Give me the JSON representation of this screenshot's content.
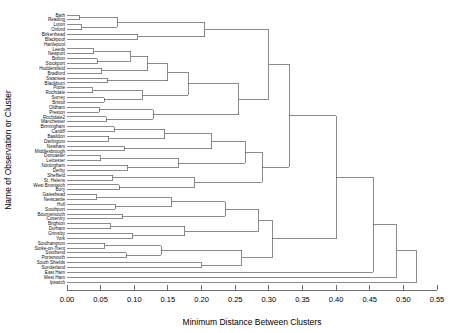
{
  "figure": {
    "type": "dendrogram",
    "xlabel": "Minimum Distance Between Clusters",
    "ylabel": "Name of Observation or Cluster"
  },
  "axis": {
    "ticks": [
      "0.00",
      "0.05",
      "0.10",
      "0.15",
      "0.20",
      "0.25",
      "0.30",
      "0.35",
      "0.40",
      "0.45",
      "0.50",
      "0.55"
    ],
    "tick_values": [
      0.0,
      0.05,
      0.1,
      0.15,
      0.2,
      0.25,
      0.3,
      0.35,
      0.4,
      0.45,
      0.5,
      0.55
    ],
    "xlim": [
      0.0,
      0.55
    ]
  },
  "chart_data": {
    "type": "dendrogram",
    "title": "",
    "xlabel": "Minimum Distance Between Clusters",
    "ylabel": "Name of Observation or Cluster",
    "xlim": [
      0.0,
      0.55
    ],
    "grid": false,
    "legend": "none",
    "orientation": "horizontal",
    "leaf_count": 56,
    "leaves": [
      "Bath",
      "Reading",
      "Luton",
      "Oxford",
      "Birkenhead",
      "Blackpool",
      "Hartlepool",
      "Leeds",
      "Newport",
      "Bolton",
      "Stockport",
      "Huddersfield",
      "Bradford",
      "Swansea",
      "Blackburn",
      "Poole",
      "Rochdale",
      "Surrey",
      "Bristol",
      "Oldham",
      "Preston",
      "Rochdale2",
      "Manchester",
      "Birmingham",
      "Cardiff",
      "Basildon",
      "Darlington",
      "Newham",
      "Middlesbrough",
      "Doncaster",
      "Leicester",
      "Nottingham",
      "Derby",
      "Sheffield",
      "St. Helens",
      "West Bromwich",
      "Bury",
      "Gateshead",
      "Newcastle",
      "Hull",
      "Southport",
      "Bournemouth",
      "Coventry",
      "Brighton",
      "Durham",
      "Grimsby",
      "York",
      "Southampton",
      "Stoke-on-Trent",
      "Southend",
      "Portsmouth",
      "South Shields",
      "Sunderland",
      "East Ham",
      "West Ham",
      "Ipswich"
    ],
    "merges": [
      {
        "children": [
          0,
          1
        ],
        "height": 0.018
      },
      {
        "children": [
          2,
          3
        ],
        "height": 0.022
      },
      {
        "children": [
          "m0",
          "m1"
        ],
        "height": 0.075
      },
      {
        "children": [
          4,
          5
        ],
        "height": 0.105
      },
      {
        "children": [
          "m2",
          "m3"
        ],
        "height": 0.205
      },
      {
        "children": [
          7,
          8
        ],
        "height": 0.04
      },
      {
        "children": [
          9,
          10
        ],
        "height": 0.045
      },
      {
        "children": [
          11,
          12
        ],
        "height": 0.052
      },
      {
        "children": [
          "m5",
          "m6"
        ],
        "height": 0.095
      },
      {
        "children": [
          "m7",
          "m8"
        ],
        "height": 0.12
      },
      {
        "children": [
          13,
          14
        ],
        "height": 0.06
      },
      {
        "children": [
          "m9",
          "m10"
        ],
        "height": 0.15
      },
      {
        "children": [
          15,
          16
        ],
        "height": 0.038
      },
      {
        "children": [
          17,
          18
        ],
        "height": 0.055
      },
      {
        "children": [
          "m12",
          "m13"
        ],
        "height": 0.112
      },
      {
        "children": [
          "m11",
          "m14"
        ],
        "height": 0.18
      },
      {
        "children": [
          19,
          20
        ],
        "height": 0.048
      },
      {
        "children": [
          21,
          22
        ],
        "height": 0.058
      },
      {
        "children": [
          "m16",
          "m17"
        ],
        "height": 0.128
      },
      {
        "children": [
          "m15",
          "m18"
        ],
        "height": 0.255
      },
      {
        "children": [
          "m4",
          "m19"
        ],
        "height": 0.3
      },
      {
        "children": [
          23,
          24
        ],
        "height": 0.07
      },
      {
        "children": [
          25,
          26
        ],
        "height": 0.062
      },
      {
        "children": [
          "m21",
          "m22"
        ],
        "height": 0.145
      },
      {
        "children": [
          27,
          28
        ],
        "height": 0.085
      },
      {
        "children": [
          "m23",
          "m24"
        ],
        "height": 0.215
      },
      {
        "children": [
          29,
          30
        ],
        "height": 0.05
      },
      {
        "children": [
          31,
          32
        ],
        "height": 0.09
      },
      {
        "children": [
          "m26",
          "m27"
        ],
        "height": 0.165
      },
      {
        "children": [
          "m25",
          "m28"
        ],
        "height": 0.265
      },
      {
        "children": [
          33,
          34
        ],
        "height": 0.068
      },
      {
        "children": [
          35,
          36
        ],
        "height": 0.078
      },
      {
        "children": [
          "m30",
          "m31"
        ],
        "height": 0.19
      },
      {
        "children": [
          "m29",
          "m32"
        ],
        "height": 0.29
      },
      {
        "children": [
          "m20",
          "m33"
        ],
        "height": 0.33
      },
      {
        "children": [
          37,
          38
        ],
        "height": 0.044
      },
      {
        "children": [
          39,
          40
        ],
        "height": 0.072
      },
      {
        "children": [
          "m35",
          "m36"
        ],
        "height": 0.155
      },
      {
        "children": [
          41,
          42
        ],
        "height": 0.082
      },
      {
        "children": [
          "m37",
          "m38"
        ],
        "height": 0.235
      },
      {
        "children": [
          43,
          44
        ],
        "height": 0.065
      },
      {
        "children": [
          45,
          46
        ],
        "height": 0.098
      },
      {
        "children": [
          "m40",
          "m41"
        ],
        "height": 0.175
      },
      {
        "children": [
          "m39",
          "m42"
        ],
        "height": 0.285
      },
      {
        "children": [
          47,
          48
        ],
        "height": 0.056
      },
      {
        "children": [
          49,
          50
        ],
        "height": 0.088
      },
      {
        "children": [
          "m44",
          "m45"
        ],
        "height": 0.14
      },
      {
        "children": [
          51,
          52
        ],
        "height": 0.2
      },
      {
        "children": [
          "m46",
          "m47"
        ],
        "height": 0.26
      },
      {
        "children": [
          "m43",
          "m48"
        ],
        "height": 0.305
      },
      {
        "children": [
          "m34",
          "m49"
        ],
        "height": 0.4
      },
      {
        "children": [
          53,
          "m50"
        ],
        "height": 0.455
      },
      {
        "children": [
          54,
          "m51"
        ],
        "height": 0.49
      },
      {
        "children": [
          55,
          "m52"
        ],
        "height": 0.52
      },
      {
        "children": [
          "m53"
        ],
        "height": 0.52
      }
    ]
  }
}
